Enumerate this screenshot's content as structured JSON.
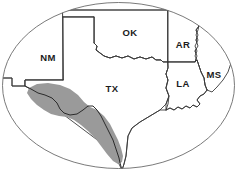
{
  "figure": {
    "width": 237,
    "height": 171,
    "background_color": "#ffffff",
    "frame_shape": "ellipse",
    "frame_color": "#6b6b6b"
  },
  "labels": {
    "new_mexico": "NM",
    "oklahoma": "OK",
    "texas": "TX",
    "arkansas": "AR",
    "louisiana": "LA",
    "mississippi": "MS"
  },
  "legend": {
    "shaded_region_name": "shaded range band",
    "shaded_region_color": "#9a9a9a",
    "river_line_name": "Rio Grande",
    "river_line_color": "#2b2b2b",
    "state_border_color": "#3a3a3a"
  }
}
